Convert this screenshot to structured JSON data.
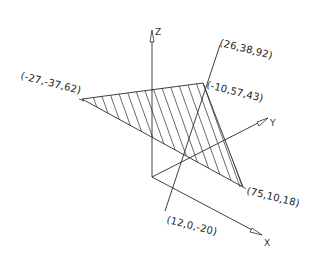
{
  "diagram": {
    "type": "3d-plane-line-intersection",
    "axes": {
      "x_label": "X",
      "y_label": "Y",
      "z_label": "Z"
    },
    "plane": {
      "fill_style": "hatched",
      "vertices": [
        {
          "id": "A",
          "label": "(-27,-37,62)",
          "coords": [
            -27,
            -37,
            62
          ]
        },
        {
          "id": "B",
          "label": "(-10,57,43)",
          "coords": [
            -10,
            57,
            43
          ]
        },
        {
          "id": "C",
          "label": "(75,10,18)",
          "coords": [
            75,
            10,
            18
          ]
        }
      ]
    },
    "line": {
      "points": [
        {
          "id": "P",
          "label": "(26,38,92)",
          "coords": [
            26,
            38,
            92
          ]
        },
        {
          "id": "Q",
          "label": "(12,0,-20)",
          "coords": [
            12,
            0,
            -20
          ]
        }
      ]
    },
    "colors": {
      "stroke": "#2a2a2a",
      "background": "#ffffff"
    }
  }
}
